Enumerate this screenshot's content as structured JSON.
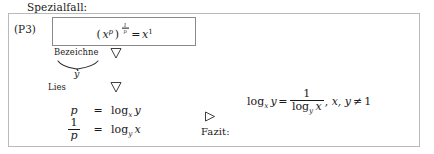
{
  "document": {
    "heading": "Spezialfall:",
    "rule_tag": "(P3)"
  },
  "formula_box": {
    "base": "x",
    "inner_exponent": "p",
    "outer_exponent_numerator": "1",
    "outer_exponent_denominator": "p",
    "relation": "=",
    "result_base": "x",
    "result_exponent": "1",
    "plain": "(x^p)^(1/p) = x^1"
  },
  "annotations": {
    "bezeichne_label": "Bezeichne",
    "lies_label": "Lies",
    "underbrace_label": "y",
    "fazit_label": "Fazit:",
    "marker_down_1": "nabla-triangle-down",
    "marker_down_2": "nabla-triangle-down",
    "marker_right": "triangle-right"
  },
  "equation_array": {
    "rows": [
      {
        "lhs": "p",
        "relation": "=",
        "rhs_operator": "log",
        "rhs_subscript": "x",
        "rhs_argument": "y",
        "plain": "p = log_x y"
      },
      {
        "lhs_numerator": "1",
        "lhs_denominator": "p",
        "relation": "=",
        "rhs_operator": "log",
        "rhs_subscript": "y",
        "rhs_argument": "x",
        "plain": "1/p = log_y x"
      }
    ]
  },
  "conclusion": {
    "lhs_operator": "log",
    "lhs_subscript": "x",
    "lhs_argument": "y",
    "relation": "=",
    "rhs_numerator": "1",
    "rhs_denominator_operator": "log",
    "rhs_denominator_subscript": "y",
    "rhs_denominator_argument": "x",
    "separator": ",",
    "condition_vars": "x, y",
    "condition_relation": "≠",
    "condition_value": "1",
    "plain": "log_x y = 1 / (log_y x),  x, y ≠ 1"
  },
  "colors": {
    "ink": "#1a1a1a",
    "outer_border": "#b9b9b9",
    "inner_border": "#8a8a8a",
    "page_background": "#ffffff"
  }
}
